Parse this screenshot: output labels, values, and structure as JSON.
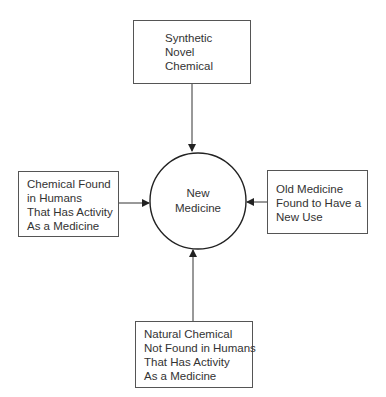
{
  "diagram": {
    "center": {
      "lines": [
        "New",
        "Medicine"
      ]
    },
    "nodes": {
      "top": {
        "lines": [
          "Synthetic",
          "Novel",
          "Chemical"
        ]
      },
      "left": {
        "lines": [
          "Chemical Found",
          "in Humans",
          "That Has Activity",
          "As a Medicine"
        ]
      },
      "right": {
        "lines": [
          "Old Medicine",
          "Found to Have a",
          "New Use"
        ]
      },
      "bottom": {
        "lines": [
          "Natural Chemical",
          "Not Found in Humans",
          "That Has Activity",
          "As a Medicine"
        ]
      }
    },
    "edges": [
      {
        "from": "top",
        "to": "center"
      },
      {
        "from": "left",
        "to": "center"
      },
      {
        "from": "right",
        "to": "center"
      },
      {
        "from": "bottom",
        "to": "center"
      }
    ],
    "colors": {
      "stroke": "#333333",
      "box_border": "#555555",
      "text": "#333333",
      "background": "#ffffff"
    }
  }
}
